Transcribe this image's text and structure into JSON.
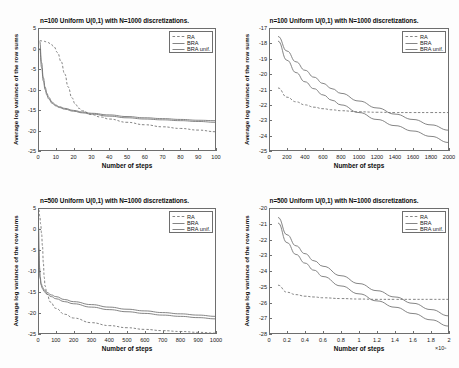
{
  "figure": {
    "background": "#fdfdfd",
    "axis_color": "#6e6e6e",
    "curve_color": "#6f6f6f"
  },
  "legend": {
    "items": [
      {
        "label": "RA",
        "style": "dashed"
      },
      {
        "label": "BRA",
        "style": "solid"
      },
      {
        "label": "BRA unif.",
        "style": "solid"
      }
    ]
  },
  "chart_data": [
    {
      "id": "top-left",
      "type": "line",
      "title": "n=100 Uniform U(0,1) with N=1000 discretizations.",
      "xlabel": "Number of steps",
      "ylabel": "Average log variance of the row sums",
      "xlim": [
        0,
        100
      ],
      "ylim": [
        -25,
        5
      ],
      "xticks": [
        0,
        10,
        20,
        30,
        40,
        50,
        60,
        70,
        80,
        90,
        100
      ],
      "yticks": [
        5,
        0,
        -5,
        -10,
        -15,
        -20,
        -25
      ],
      "grid": false,
      "legend_position": "top-right",
      "series": [
        {
          "name": "RA",
          "style": "dashed",
          "x": [
            1,
            3,
            5,
            7,
            9,
            11,
            13,
            15,
            17,
            19,
            21,
            23,
            25,
            30,
            35,
            40,
            50,
            60,
            70,
            80,
            90,
            100
          ],
          "y": [
            1.9,
            1.8,
            1.6,
            1.2,
            0.4,
            -1.0,
            -3.2,
            -6.2,
            -9.4,
            -12.0,
            -13.6,
            -14.6,
            -15.2,
            -16.1,
            -16.7,
            -17.2,
            -18.0,
            -18.6,
            -19.1,
            -19.5,
            -19.9,
            -20.3
          ]
        },
        {
          "name": "BRA",
          "style": "solid",
          "x": [
            1,
            2,
            3,
            4,
            5,
            6,
            8,
            10,
            12,
            15,
            20,
            25,
            30,
            40,
            50,
            60,
            70,
            80,
            90,
            100
          ],
          "y": [
            0.1,
            -4.6,
            -7.9,
            -10.0,
            -11.4,
            -12.3,
            -13.4,
            -14.0,
            -14.4,
            -14.8,
            -15.3,
            -15.7,
            -16.0,
            -16.5,
            -16.9,
            -17.2,
            -17.4,
            -17.6,
            -17.8,
            -18.0
          ]
        },
        {
          "name": "BRA unif.",
          "style": "solid",
          "x": [
            1,
            2,
            3,
            4,
            5,
            6,
            8,
            10,
            12,
            15,
            20,
            25,
            30,
            40,
            50,
            60,
            70,
            80,
            90,
            100
          ],
          "y": [
            1.7,
            -3.4,
            -7.1,
            -9.4,
            -10.9,
            -11.9,
            -13.1,
            -13.8,
            -14.2,
            -14.6,
            -15.1,
            -15.5,
            -15.8,
            -16.2,
            -16.6,
            -16.9,
            -17.1,
            -17.3,
            -17.5,
            -17.6
          ]
        }
      ]
    },
    {
      "id": "top-right",
      "type": "line",
      "title": "n=100 Uniform U(0,1) with N=1000 discretizations.",
      "xlabel": "Number of steps",
      "ylabel": "Average log variance of the row sums",
      "xlim": [
        0,
        2000
      ],
      "ylim": [
        -25,
        -17
      ],
      "xticks": [
        0,
        200,
        400,
        600,
        800,
        1000,
        1200,
        1400,
        1600,
        1800,
        2000
      ],
      "yticks": [
        -17,
        -18,
        -19,
        -20,
        -21,
        -22,
        -23,
        -24,
        -25
      ],
      "grid": false,
      "legend_position": "top-right",
      "series": [
        {
          "name": "RA",
          "style": "dashed",
          "x": [
            100,
            200,
            300,
            400,
            500,
            600,
            700,
            800,
            1000,
            1200,
            1400,
            1600,
            1800,
            2000
          ],
          "y": [
            -20.9,
            -21.5,
            -21.8,
            -22.0,
            -22.15,
            -22.25,
            -22.32,
            -22.38,
            -22.45,
            -22.48,
            -22.5,
            -22.5,
            -22.5,
            -22.5
          ]
        },
        {
          "name": "BRA",
          "style": "solid",
          "x": [
            100,
            200,
            300,
            400,
            500,
            600,
            700,
            800,
            1000,
            1200,
            1400,
            1600,
            1800,
            2000
          ],
          "y": [
            -17.85,
            -19.1,
            -19.9,
            -20.5,
            -20.95,
            -21.35,
            -21.7,
            -22.0,
            -22.5,
            -22.95,
            -23.35,
            -23.7,
            -24.05,
            -24.45
          ]
        },
        {
          "name": "BRA unif.",
          "style": "solid",
          "x": [
            100,
            200,
            300,
            400,
            500,
            600,
            700,
            800,
            1000,
            1200,
            1400,
            1600,
            1800,
            2000
          ],
          "y": [
            -17.55,
            -18.5,
            -19.2,
            -19.75,
            -20.2,
            -20.6,
            -20.95,
            -21.25,
            -21.75,
            -22.2,
            -22.6,
            -22.95,
            -23.3,
            -23.65
          ]
        }
      ]
    },
    {
      "id": "bottom-left",
      "type": "line",
      "title": "n=500 Uniform U(0,1) with N=1000 discretizations.",
      "xlabel": "Number of steps",
      "ylabel": "Average log variance of the row sums",
      "xlim": [
        0,
        1000
      ],
      "ylim": [
        -25,
        5
      ],
      "xticks": [
        0,
        100,
        200,
        300,
        400,
        500,
        600,
        700,
        800,
        900,
        1000
      ],
      "yticks": [
        5,
        0,
        -5,
        -10,
        -15,
        -20,
        -25
      ],
      "grid": false,
      "legend_position": "top-right",
      "series": [
        {
          "name": "RA",
          "style": "dashed",
          "x": [
            5,
            10,
            15,
            20,
            25,
            30,
            35,
            40,
            50,
            70,
            100,
            150,
            200,
            300,
            400,
            500,
            600,
            700,
            800,
            900,
            1000
          ],
          "y": [
            4.6,
            3.0,
            1.2,
            -1.0,
            -4.0,
            -8.0,
            -11.5,
            -13.6,
            -15.5,
            -17.4,
            -18.9,
            -20.3,
            -21.2,
            -22.3,
            -23.0,
            -23.5,
            -23.9,
            -24.2,
            -24.4,
            -24.6,
            -24.8
          ]
        },
        {
          "name": "BRA",
          "style": "solid",
          "x": [
            3,
            5,
            8,
            12,
            18,
            25,
            35,
            50,
            75,
            100,
            150,
            200,
            300,
            400,
            500,
            600,
            700,
            800,
            900,
            1000
          ],
          "y": [
            0.3,
            -5.0,
            -9.2,
            -11.8,
            -13.4,
            -14.2,
            -14.9,
            -15.5,
            -16.1,
            -16.6,
            -17.3,
            -17.8,
            -18.6,
            -19.2,
            -19.7,
            -20.1,
            -20.5,
            -20.8,
            -21.1,
            -21.4
          ]
        },
        {
          "name": "BRA unif.",
          "style": "solid",
          "x": [
            3,
            5,
            8,
            12,
            18,
            25,
            35,
            50,
            75,
            100,
            150,
            200,
            300,
            400,
            500,
            600,
            700,
            800,
            900,
            1000
          ],
          "y": [
            0.5,
            -4.6,
            -8.8,
            -11.4,
            -13.0,
            -13.8,
            -14.5,
            -15.1,
            -15.7,
            -16.1,
            -16.8,
            -17.3,
            -18.0,
            -18.6,
            -19.1,
            -19.5,
            -19.9,
            -20.2,
            -20.5,
            -20.8
          ]
        }
      ]
    },
    {
      "id": "bottom-right",
      "type": "line",
      "title": "n=500 Uniform U(0,1) with N=1000 discretizations.",
      "xlabel": "Number of steps",
      "ylabel": "Average log variance of the row sums",
      "x_multiplier": "×10⁵",
      "xlim": [
        0,
        2
      ],
      "ylim": [
        -28,
        -20
      ],
      "xticks": [
        0,
        0.2,
        0.4,
        0.6,
        0.8,
        1,
        1.2,
        1.4,
        1.6,
        1.8,
        2
      ],
      "yticks": [
        -20,
        -21,
        -22,
        -23,
        -24,
        -25,
        -26,
        -27,
        -28
      ],
      "grid": false,
      "legend_position": "top-right",
      "series": [
        {
          "name": "RA",
          "style": "dashed",
          "x": [
            0.1,
            0.2,
            0.3,
            0.4,
            0.5,
            0.6,
            0.8,
            1.0,
            1.2,
            1.4,
            1.6,
            1.8,
            2.0
          ],
          "y": [
            -24.9,
            -25.35,
            -25.5,
            -25.6,
            -25.65,
            -25.7,
            -25.75,
            -25.78,
            -25.8,
            -25.8,
            -25.8,
            -25.8,
            -25.8
          ]
        },
        {
          "name": "BRA",
          "style": "solid",
          "x": [
            0.1,
            0.2,
            0.3,
            0.4,
            0.5,
            0.6,
            0.8,
            1.0,
            1.2,
            1.4,
            1.6,
            1.8,
            2.0
          ],
          "y": [
            -20.95,
            -22.2,
            -22.95,
            -23.5,
            -23.95,
            -24.35,
            -24.95,
            -25.45,
            -25.9,
            -26.3,
            -26.7,
            -27.1,
            -27.5
          ]
        },
        {
          "name": "BRA unif.",
          "style": "solid",
          "x": [
            0.1,
            0.2,
            0.3,
            0.4,
            0.5,
            0.6,
            0.8,
            1.0,
            1.2,
            1.4,
            1.6,
            1.8,
            2.0
          ],
          "y": [
            -20.6,
            -21.7,
            -22.4,
            -22.9,
            -23.35,
            -23.7,
            -24.3,
            -24.8,
            -25.25,
            -25.65,
            -26.05,
            -26.45,
            -26.85
          ]
        }
      ]
    }
  ]
}
